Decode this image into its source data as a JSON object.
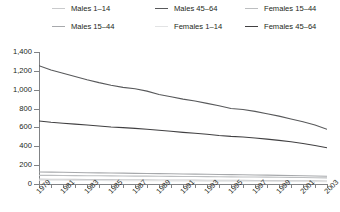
{
  "legend": {
    "position": "top",
    "items": [
      {
        "label": "Males 1–14",
        "color": "#c9cacc",
        "col": 0,
        "row": 0
      },
      {
        "label": "Males 15–44",
        "color": "#a7a9ac",
        "col": 0,
        "row": 1
      },
      {
        "label": "Males 45–64",
        "color": "#58595b",
        "col": 1,
        "row": 0
      },
      {
        "label": "Females 1–14",
        "color": "#e2e3e4",
        "col": 1,
        "row": 1
      },
      {
        "label": "Females 15–44",
        "color": "#bcbec0",
        "col": 2,
        "row": 0
      },
      {
        "label": "Females 45–64",
        "color": "#414042",
        "col": 2,
        "row": 1
      }
    ]
  },
  "axes": {
    "y_ticks": [
      "1,400",
      "1,200",
      "1,000",
      "800",
      "600",
      "400",
      "200",
      "0"
    ],
    "x_ticks": [
      "1979",
      "1981",
      "1983",
      "1985",
      "1987",
      "1989",
      "1991",
      "1993",
      "1995",
      "1997",
      "1999",
      "2001",
      "2003"
    ]
  },
  "chart_data": {
    "type": "line",
    "title": "",
    "xlabel": "",
    "ylabel": "",
    "xlim": [
      1979,
      2003
    ],
    "ylim": [
      0,
      1400
    ],
    "ytick_values": [
      0,
      200,
      400,
      600,
      800,
      1000,
      1200,
      1400
    ],
    "xtick_values": [
      1979,
      1981,
      1983,
      1985,
      1987,
      1989,
      1991,
      1993,
      1995,
      1997,
      1999,
      2001,
      2003
    ],
    "grid": false,
    "legend_position": "top",
    "x": [
      1979,
      1980,
      1981,
      1982,
      1983,
      1984,
      1985,
      1986,
      1987,
      1988,
      1989,
      1990,
      1991,
      1992,
      1993,
      1994,
      1995,
      1996,
      1997,
      1998,
      1999,
      2000,
      2001,
      2002,
      2003
    ],
    "series": [
      {
        "name": "Males 45–64",
        "color": "#58595b",
        "values": [
          1255,
          1210,
          1175,
          1140,
          1105,
          1075,
          1048,
          1025,
          1010,
          985,
          950,
          925,
          900,
          880,
          855,
          830,
          800,
          790,
          770,
          745,
          720,
          690,
          660,
          625,
          580
        ]
      },
      {
        "name": "Females 45–64",
        "color": "#414042",
        "values": [
          668,
          655,
          645,
          635,
          625,
          615,
          605,
          598,
          590,
          580,
          570,
          560,
          548,
          538,
          528,
          515,
          505,
          498,
          488,
          476,
          463,
          448,
          430,
          408,
          385
        ]
      },
      {
        "name": "Males 15–44",
        "color": "#a7a9ac",
        "values": [
          128,
          126,
          124,
          122,
          120,
          118,
          116,
          115,
          113,
          112,
          110,
          108,
          106,
          105,
          103,
          101,
          99,
          98,
          96,
          94,
          92,
          90,
          88,
          85,
          82
        ]
      },
      {
        "name": "Females 15–44",
        "color": "#bcbec0",
        "values": [
          92,
          91,
          90,
          89,
          88,
          87,
          86,
          85,
          84,
          83,
          82,
          81,
          80,
          79,
          78,
          77,
          76,
          75,
          74,
          73,
          72,
          70,
          69,
          67,
          65
        ]
      },
      {
        "name": "Males 1–14",
        "color": "#c9cacc",
        "values": [
          52,
          51,
          50,
          49,
          48,
          47,
          46,
          45,
          45,
          44,
          43,
          42,
          42,
          41,
          40,
          39,
          39,
          38,
          37,
          36,
          36,
          35,
          34,
          33,
          32
        ]
      },
      {
        "name": "Females 1–14",
        "color": "#e2e3e4",
        "values": [
          40,
          39,
          39,
          38,
          37,
          37,
          36,
          35,
          35,
          34,
          34,
          33,
          32,
          32,
          31,
          31,
          30,
          30,
          29,
          29,
          28,
          27,
          27,
          26,
          25
        ]
      }
    ]
  }
}
